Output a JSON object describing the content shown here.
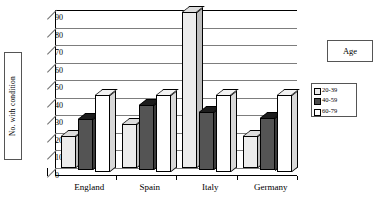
{
  "axis": {
    "y_title": "No. with condition",
    "y_ticks": [
      0,
      10,
      20,
      30,
      40,
      50,
      60,
      70,
      80,
      90
    ]
  },
  "legend": {
    "title": "Age",
    "items": [
      {
        "label": "20-39",
        "color": "#ececec"
      },
      {
        "label": "40-59",
        "color": "#4a4a4a"
      },
      {
        "label": "60-79",
        "color": "#ffffff"
      }
    ]
  },
  "chart_data": {
    "type": "bar",
    "title": "",
    "xlabel": "",
    "ylabel": "No. with condition",
    "ylim": [
      0,
      90
    ],
    "ytick_step": 10,
    "grid": true,
    "legend_position": "right",
    "legend_title": "Age",
    "categories": [
      "England",
      "Spain",
      "Italy",
      "Germany"
    ],
    "series": [
      {
        "name": "20-39",
        "color": "#ececec",
        "values": [
          18,
          25,
          89,
          18
        ]
      },
      {
        "name": "40-59",
        "color": "#4a4a4a",
        "values": [
          29,
          37,
          33,
          30
        ]
      },
      {
        "name": "60-79",
        "color": "#ffffff",
        "values": [
          44,
          44,
          44,
          44
        ]
      }
    ]
  }
}
